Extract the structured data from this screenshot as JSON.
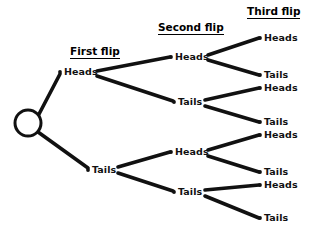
{
  "diagram": {
    "background_color": "#ffffff",
    "line_color": "#111111",
    "text_color": "#111111",
    "headers": [
      {
        "label": "First flip",
        "x": 70,
        "y": 46
      },
      {
        "label": "Second flip",
        "x": 158,
        "y": 22
      },
      {
        "label": "Third flip",
        "x": 247,
        "y": 6
      }
    ],
    "root": {
      "name": "start",
      "cx": 28,
      "cy": 123,
      "r": 13,
      "fill": "#ffffff",
      "stroke": "#111111",
      "stroke_width": 3
    },
    "level1": [
      {
        "label": "Heads",
        "x": 64,
        "y": 67,
        "dot_x": 60,
        "dot_y": 72
      },
      {
        "label": "Tails",
        "x": 92,
        "y": 165,
        "dot_x": 88,
        "dot_y": 170
      }
    ],
    "level2": [
      {
        "label": "Heads",
        "x": 175,
        "y": 52,
        "dot_x": 171,
        "dot_y": 57
      },
      {
        "label": "Tails",
        "x": 178,
        "y": 97,
        "dot_x": 174,
        "dot_y": 102
      },
      {
        "label": "Heads",
        "x": 175,
        "y": 147,
        "dot_x": 171,
        "dot_y": 152
      },
      {
        "label": "Tails",
        "x": 178,
        "y": 187,
        "dot_x": 174,
        "dot_y": 192
      }
    ],
    "level3": [
      {
        "label": "Heads",
        "x": 264,
        "y": 33,
        "dot_x": 260,
        "dot_y": 38
      },
      {
        "label": "Tails",
        "x": 264,
        "y": 70,
        "dot_x": 260,
        "dot_y": 75
      },
      {
        "label": "Heads",
        "x": 264,
        "y": 83,
        "dot_x": 260,
        "dot_y": 88
      },
      {
        "label": "Tails",
        "x": 264,
        "y": 117,
        "dot_x": 260,
        "dot_y": 122
      },
      {
        "label": "Heads",
        "x": 264,
        "y": 130,
        "dot_x": 260,
        "dot_y": 135
      },
      {
        "label": "Tails",
        "x": 264,
        "y": 167,
        "dot_x": 260,
        "dot_y": 172
      },
      {
        "label": "Heads",
        "x": 264,
        "y": 180,
        "dot_x": 260,
        "dot_y": 185
      },
      {
        "label": "Tails",
        "x": 264,
        "y": 213,
        "dot_x": 260,
        "dot_y": 218
      }
    ],
    "branches": [
      {
        "name": "root-to-heads",
        "x1": 38,
        "y1": 116,
        "x2": 60,
        "y2": 74
      },
      {
        "name": "root-to-tails",
        "x1": 38,
        "y1": 132,
        "x2": 88,
        "y2": 168
      },
      {
        "name": "heads-to-heads",
        "x1": 97,
        "y1": 71,
        "x2": 170,
        "y2": 57
      },
      {
        "name": "heads-to-tails",
        "x1": 97,
        "y1": 76,
        "x2": 173,
        "y2": 101
      },
      {
        "name": "tails-to-heads",
        "x1": 118,
        "y1": 167,
        "x2": 170,
        "y2": 152
      },
      {
        "name": "tails-to-tails",
        "x1": 118,
        "y1": 173,
        "x2": 173,
        "y2": 191
      },
      {
        "name": "hh-to-heads",
        "x1": 208,
        "y1": 55,
        "x2": 259,
        "y2": 38
      },
      {
        "name": "hh-to-tails",
        "x1": 208,
        "y1": 60,
        "x2": 259,
        "y2": 75
      },
      {
        "name": "ht-to-heads",
        "x1": 205,
        "y1": 100,
        "x2": 259,
        "y2": 88
      },
      {
        "name": "ht-to-tails",
        "x1": 205,
        "y1": 106,
        "x2": 259,
        "y2": 122
      },
      {
        "name": "th-to-heads",
        "x1": 208,
        "y1": 150,
        "x2": 259,
        "y2": 135
      },
      {
        "name": "th-to-tails",
        "x1": 208,
        "y1": 156,
        "x2": 259,
        "y2": 172
      },
      {
        "name": "tt-to-heads",
        "x1": 205,
        "y1": 190,
        "x2": 259,
        "y2": 185
      },
      {
        "name": "tt-to-tails",
        "x1": 205,
        "y1": 196,
        "x2": 259,
        "y2": 218
      }
    ]
  }
}
